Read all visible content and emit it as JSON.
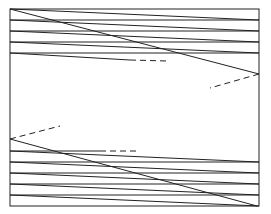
{
  "diagram": {
    "colors": {
      "line": "#222222",
      "background": "#ffffff"
    },
    "frame": {
      "x": 10,
      "y": 9,
      "width": 249,
      "height": 197
    },
    "top_section": {
      "slanted_lines": [
        {
          "x1": 10,
          "y1": 9,
          "x2": 259,
          "y2": 20
        },
        {
          "x1": 10,
          "y1": 20,
          "x2": 259,
          "y2": 31
        },
        {
          "x1": 10,
          "y1": 31,
          "x2": 259,
          "y2": 42
        },
        {
          "x1": 10,
          "y1": 42,
          "x2": 259,
          "y2": 53
        }
      ],
      "horizontal_lines": [
        {
          "x1": 10,
          "y1": 20,
          "x2": 259,
          "y2": 20
        },
        {
          "x1": 10,
          "y1": 31,
          "x2": 259,
          "y2": 31
        },
        {
          "x1": 10,
          "y1": 42,
          "x2": 259,
          "y2": 42
        },
        {
          "x1": 10,
          "y1": 53,
          "x2": 259,
          "y2": 53
        }
      ],
      "partial_line": {
        "x1": 10,
        "y1": 53,
        "x2": 130,
        "y2": 60
      },
      "partial_dashed": {
        "x1": 130,
        "y1": 60,
        "x2": 167,
        "y2": 61
      },
      "diagonal": {
        "x1": 10,
        "y1": 9,
        "x2": 259,
        "y2": 74
      },
      "dashed_exit": {
        "x1": 259,
        "y1": 74,
        "x2": 210,
        "y2": 88
      }
    },
    "bottom_section": {
      "dashed_entry": {
        "x1": 10,
        "y1": 139,
        "x2": 60,
        "y2": 126
      },
      "diagonal": {
        "x1": 10,
        "y1": 139,
        "x2": 257,
        "y2": 206
      },
      "partial_line": {
        "x1": 10,
        "y1": 151,
        "x2": 100,
        "y2": 151
      },
      "partial_dashed": {
        "x1": 100,
        "y1": 151,
        "x2": 139,
        "y2": 151
      },
      "slanted_lines": [
        {
          "x1": 10,
          "y1": 151,
          "x2": 259,
          "y2": 162
        },
        {
          "x1": 10,
          "y1": 162,
          "x2": 259,
          "y2": 173
        },
        {
          "x1": 10,
          "y1": 173,
          "x2": 259,
          "y2": 184
        },
        {
          "x1": 10,
          "y1": 184,
          "x2": 259,
          "y2": 195
        },
        {
          "x1": 10,
          "y1": 195,
          "x2": 259,
          "y2": 206
        }
      ],
      "horizontal_lines": [
        {
          "x1": 10,
          "y1": 162,
          "x2": 259,
          "y2": 162
        },
        {
          "x1": 10,
          "y1": 173,
          "x2": 259,
          "y2": 173
        },
        {
          "x1": 10,
          "y1": 184,
          "x2": 259,
          "y2": 184
        },
        {
          "x1": 10,
          "y1": 195,
          "x2": 259,
          "y2": 195
        }
      ]
    }
  }
}
